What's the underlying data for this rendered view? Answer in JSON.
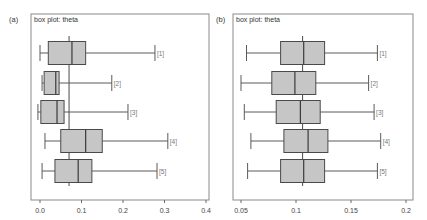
{
  "chart_data": [
    {
      "type": "box",
      "panel_label": "(a)",
      "title": "box plot: theta",
      "xlabel": "",
      "ylabel": "",
      "xlim": [
        -0.005,
        0.405
      ],
      "xticks": [
        0.0,
        0.1,
        0.2,
        0.3,
        0.4
      ],
      "xtick_labels": [
        "0.0",
        "0.1",
        "0.2",
        "0.3",
        "0.4"
      ],
      "reference_line": 0.07,
      "grid": false,
      "series": [
        {
          "name": "[1]",
          "whisker_low": 0.0,
          "q1": 0.02,
          "median": 0.077,
          "q3": 0.11,
          "whisker_high": 0.277
        },
        {
          "name": "[2]",
          "whisker_low": 0.005,
          "q1": 0.01,
          "median": 0.038,
          "q3": 0.046,
          "whisker_high": 0.173
        },
        {
          "name": "[3]",
          "whisker_low": -0.005,
          "q1": 0.002,
          "median": 0.041,
          "q3": 0.058,
          "whisker_high": 0.212
        },
        {
          "name": "[4]",
          "whisker_low": 0.012,
          "q1": 0.05,
          "median": 0.11,
          "q3": 0.15,
          "whisker_high": 0.308
        },
        {
          "name": "[5]",
          "whisker_low": 0.005,
          "q1": 0.036,
          "median": 0.092,
          "q3": 0.125,
          "whisker_high": 0.282
        }
      ]
    },
    {
      "type": "box",
      "panel_label": "(b)",
      "title": "box plot: theta",
      "xlabel": "",
      "ylabel": "",
      "xlim": [
        0.042,
        0.203
      ],
      "xticks": [
        0.05,
        0.1,
        0.15,
        0.2
      ],
      "xtick_labels": [
        "0.05",
        "0.1",
        "0.15",
        "0.2"
      ],
      "reference_line": 0.106,
      "grid": false,
      "series": [
        {
          "name": "[1]",
          "whisker_low": 0.055,
          "q1": 0.086,
          "median": 0.107,
          "q3": 0.126,
          "whisker_high": 0.174
        },
        {
          "name": "[2]",
          "whisker_low": 0.05,
          "q1": 0.078,
          "median": 0.099,
          "q3": 0.118,
          "whisker_high": 0.166
        },
        {
          "name": "[3]",
          "whisker_low": 0.053,
          "q1": 0.082,
          "median": 0.104,
          "q3": 0.122,
          "whisker_high": 0.171
        },
        {
          "name": "[4]",
          "whisker_low": 0.059,
          "q1": 0.089,
          "median": 0.111,
          "q3": 0.129,
          "whisker_high": 0.177
        },
        {
          "name": "[5]",
          "whisker_low": 0.056,
          "q1": 0.086,
          "median": 0.107,
          "q3": 0.126,
          "whisker_high": 0.174
        }
      ]
    }
  ],
  "panels": [
    {
      "label": "(a)",
      "title": "box plot: theta"
    },
    {
      "label": "(b)",
      "title": "box plot: theta"
    }
  ],
  "colors": {
    "box_fill": "#c6c6c6",
    "box_stroke": "#4a4a4a",
    "frame": "#8a8a8a"
  }
}
